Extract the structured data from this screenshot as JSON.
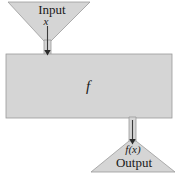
{
  "diagram": {
    "colors": {
      "shape_fill": "#d5d5d5",
      "shape_stroke": "#9a9a9a",
      "arrow": "#2b2b2b",
      "text": "#1a1a1a",
      "background": "#ffffff"
    },
    "input_funnel": {
      "label": "Input",
      "variable_label": "x"
    },
    "machine_box": {
      "label": "f"
    },
    "output_funnel": {
      "value_label": "f(x)",
      "label": "Output"
    },
    "arrows": [
      {
        "name": "input-arrow",
        "direction": "down"
      },
      {
        "name": "output-arrow",
        "direction": "down"
      }
    ]
  }
}
